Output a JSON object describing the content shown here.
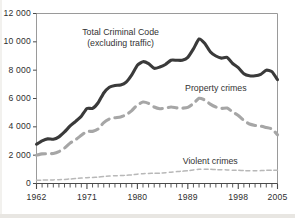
{
  "chart_data": {
    "type": "line",
    "title": "",
    "xlabel": "",
    "ylabel": "",
    "xlim": [
      1962,
      2005
    ],
    "ylim": [
      0,
      12000
    ],
    "grid": false,
    "legend_position": "inline-annotations",
    "y_ticks": [
      0,
      2000,
      4000,
      6000,
      8000,
      10000,
      12000
    ],
    "y_tick_labels": [
      "0",
      "2 000",
      "4 000",
      "6 000",
      "8 000",
      "10 000",
      "12 000"
    ],
    "x_ticks": [
      1962,
      1971,
      1980,
      1989,
      1998,
      2005
    ],
    "x_tick_labels": [
      "1962",
      "1971",
      "1980",
      "1989",
      "1998",
      "2005"
    ],
    "x_minor_tick_interval": 1,
    "annotations": [
      {
        "text_line1": "Total Criminal Code",
        "text_line2": "(excluding traffic)",
        "x": 1977,
        "y": 10600
      },
      {
        "text_line1": "Property crimes",
        "text_line2": "",
        "x": 1994,
        "y": 6700
      },
      {
        "text_line1": "Violent crimes",
        "text_line2": "",
        "x": 1993,
        "y": 1550
      }
    ],
    "x": [
      1962,
      1963,
      1964,
      1965,
      1966,
      1967,
      1968,
      1969,
      1970,
      1971,
      1972,
      1973,
      1974,
      1975,
      1976,
      1977,
      1978,
      1979,
      1980,
      1981,
      1982,
      1983,
      1984,
      1985,
      1986,
      1987,
      1988,
      1989,
      1990,
      1991,
      1992,
      1993,
      1994,
      1995,
      1996,
      1997,
      1998,
      1999,
      2000,
      2001,
      2002,
      2003,
      2004,
      2005
    ],
    "series": [
      {
        "name": "Total Criminal Code (excluding traffic)",
        "style": "solid",
        "color": "#3a3a3a",
        "width": 3.1,
        "values": [
          2771,
          3010,
          3152,
          3120,
          3290,
          3640,
          4060,
          4390,
          4750,
          5300,
          5300,
          5700,
          6390,
          6800,
          6920,
          6950,
          7160,
          7670,
          8340,
          8600,
          8460,
          8130,
          8220,
          8400,
          8700,
          8700,
          8700,
          8900,
          9500,
          10200,
          9900,
          9300,
          9000,
          8850,
          8900,
          8470,
          8180,
          7750,
          7600,
          7600,
          7700,
          8000,
          7900,
          7330
        ]
      },
      {
        "name": "Property crimes",
        "style": "dashed",
        "color": "#a6a6a6",
        "width": 3.1,
        "values": [
          2000,
          2090,
          2110,
          2120,
          2250,
          2500,
          2850,
          3100,
          3400,
          3680,
          3680,
          3850,
          4300,
          4560,
          4640,
          4700,
          4850,
          5150,
          5550,
          5750,
          5650,
          5400,
          5280,
          5320,
          5400,
          5340,
          5320,
          5370,
          5650,
          6020,
          5900,
          5600,
          5400,
          5300,
          5330,
          5050,
          4800,
          4450,
          4200,
          4100,
          4050,
          3950,
          3850,
          3440
        ]
      },
      {
        "name": "Violent crimes",
        "style": "fine-dashed",
        "color": "#b8b8b8",
        "width": 1.5,
        "values": [
          221,
          240,
          250,
          255,
          270,
          290,
          320,
          350,
          380,
          410,
          425,
          450,
          490,
          530,
          550,
          560,
          580,
          610,
          660,
          690,
          710,
          720,
          730,
          760,
          800,
          840,
          870,
          900,
          960,
          1010,
          1010,
          1000,
          980,
          970,
          960,
          940,
          930,
          910,
          900,
          900,
          910,
          930,
          930,
          930
        ]
      }
    ]
  }
}
